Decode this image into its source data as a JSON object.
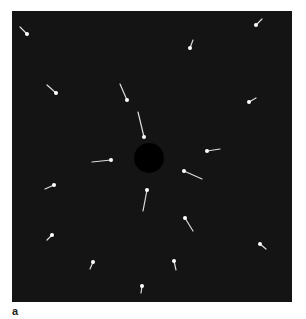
{
  "figure": {
    "panel_label": "a",
    "background_color": "#141414",
    "marker_color": "#ffffff",
    "hole_color": "#000000",
    "center_hole": {
      "cx": 149,
      "cy": 158,
      "r": 15
    },
    "markers": [
      {
        "head": [
          256,
          25
        ],
        "tail": [
          262,
          19
        ]
      },
      {
        "head": [
          27,
          34
        ],
        "tail": [
          20,
          27
        ]
      },
      {
        "head": [
          190,
          48
        ],
        "tail": [
          193,
          40
        ]
      },
      {
        "head": [
          56,
          93
        ],
        "tail": [
          47,
          85
        ]
      },
      {
        "head": [
          127,
          100
        ],
        "tail": [
          120,
          84
        ]
      },
      {
        "head": [
          249,
          102
        ],
        "tail": [
          256,
          98
        ]
      },
      {
        "head": [
          144,
          137
        ],
        "tail": [
          138,
          112
        ]
      },
      {
        "head": [
          207,
          151
        ],
        "tail": [
          220,
          149
        ]
      },
      {
        "head": [
          111,
          160
        ],
        "tail": [
          92,
          162
        ]
      },
      {
        "head": [
          184,
          171
        ],
        "tail": [
          202,
          179
        ]
      },
      {
        "head": [
          54,
          185
        ],
        "tail": [
          45,
          189
        ]
      },
      {
        "head": [
          147,
          190
        ],
        "tail": [
          143,
          211
        ]
      },
      {
        "head": [
          52,
          235
        ],
        "tail": [
          47,
          240
        ]
      },
      {
        "head": [
          185,
          218
        ],
        "tail": [
          193,
          231
        ]
      },
      {
        "head": [
          93,
          262
        ],
        "tail": [
          90,
          269
        ]
      },
      {
        "head": [
          260,
          244
        ],
        "tail": [
          266,
          249
        ]
      },
      {
        "head": [
          174,
          261
        ],
        "tail": [
          176,
          270
        ]
      },
      {
        "head": [
          142,
          286
        ],
        "tail": [
          141,
          293
        ]
      }
    ]
  }
}
